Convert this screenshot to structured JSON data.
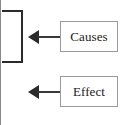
{
  "diagram": {
    "type": "cause-effect-fragment",
    "background_color": "#ffffff",
    "line_color": "#2b2b2b",
    "box_border_color": "#9a9a9a",
    "text_color": "#1c1c1c",
    "bracket": {
      "glyph": "]",
      "semantic": "closing-bracket-grouping-causes"
    },
    "nodes": [
      {
        "id": "causes",
        "label": "Causes",
        "arrow_direction": "left",
        "arrow_target": "bracket"
      },
      {
        "id": "effect",
        "label": "Effect",
        "arrow_direction": "left",
        "arrow_target": "bracket"
      }
    ],
    "edge_rule": {
      "present": true,
      "color": "#8a8a8a"
    }
  }
}
